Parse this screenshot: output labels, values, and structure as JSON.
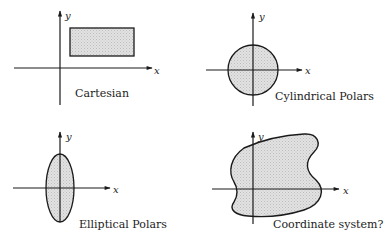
{
  "diagram": {
    "colors": {
      "stroke": "#1a1a1a",
      "fill": "#dcdcdc",
      "background": "#ffffff"
    },
    "panels": [
      {
        "id": "cartesian",
        "caption": "Cartesian",
        "x_label": "x",
        "y_label": "y",
        "shape": "rectangle"
      },
      {
        "id": "cylindrical",
        "caption": "Cylindrical Polars",
        "x_label": "x",
        "y_label": "y",
        "shape": "circle"
      },
      {
        "id": "elliptical",
        "caption": "Elliptical Polars",
        "x_label": "x",
        "y_label": "y",
        "shape": "ellipse"
      },
      {
        "id": "arbitrary",
        "caption": "Coordinate system?",
        "x_label": "x",
        "y_label": "y",
        "shape": "irregular-blob"
      }
    ]
  }
}
